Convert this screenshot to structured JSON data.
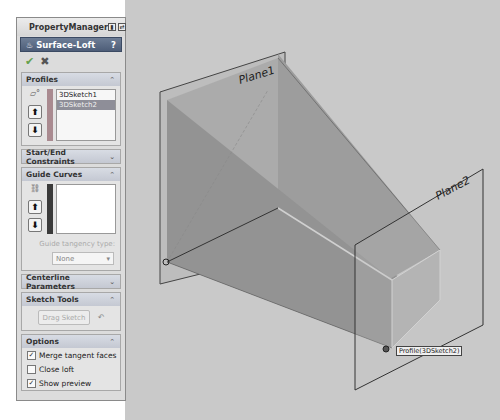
{
  "property_manager": {
    "title": "PropertyManager",
    "header_icons": [
      "pin-icon",
      "collapse-icon"
    ],
    "feature": {
      "icon": "surface-loft-icon",
      "title": "Surface-Loft",
      "help": "?"
    },
    "actions": {
      "ok": "✔",
      "cancel": "✖"
    },
    "groups": {
      "profiles": {
        "title": "Profiles",
        "chevron": "⌃",
        "color_bar": "#a98a90",
        "items": [
          {
            "label": "3DSketch1",
            "selected": false
          },
          {
            "label": "3DSketch2",
            "selected": true
          }
        ]
      },
      "start_end": {
        "title": "Start/End Constraints",
        "chevron": "⌄"
      },
      "guide_curves": {
        "title": "Guide Curves",
        "chevron": "⌃",
        "color_bar": "#3a3a3a",
        "items": [],
        "tangency_label": "Guide tangency type:",
        "tangency_value": "None"
      },
      "centerline": {
        "title": "Centerline Parameters",
        "chevron": "⌄"
      },
      "sketch_tools": {
        "title": "Sketch Tools",
        "chevron": "⌃",
        "drag_label": "Drag Sketch",
        "undo_icon": "↶"
      },
      "options": {
        "title": "Options",
        "chevron": "⌃",
        "checks": [
          {
            "label": "Merge tangent faces",
            "checked": true
          },
          {
            "label": "Close loft",
            "checked": false
          },
          {
            "label": "Show preview",
            "checked": true
          }
        ]
      }
    }
  },
  "viewport": {
    "planes": [
      {
        "name": "Plane1"
      },
      {
        "name": "Plane2"
      }
    ],
    "tooltip": "Profile(3DSketch2)",
    "colors": {
      "background": "#c9c9c9",
      "loft_dark": "#8c8c8c",
      "loft_mid": "#a4a4a4",
      "plane_fill": "#b8b8b8"
    }
  }
}
